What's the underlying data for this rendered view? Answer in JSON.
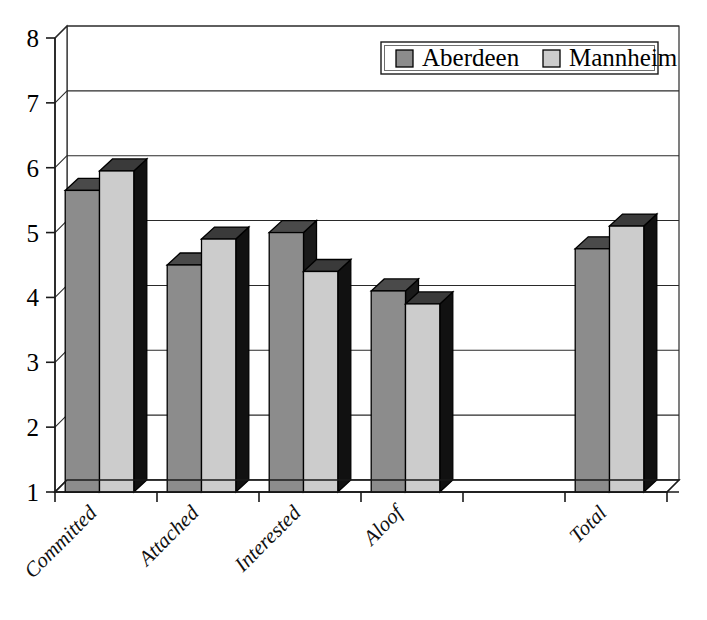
{
  "chart_data": {
    "type": "bar",
    "title": "",
    "subtitle": "",
    "xlabel": "",
    "ylabel": "",
    "ylim": [
      1,
      8
    ],
    "yticks": [
      1,
      2,
      3,
      4,
      5,
      6,
      7,
      8
    ],
    "ytick_labels": [
      "1",
      "2",
      "3",
      "4",
      "5",
      "6",
      "7",
      "8"
    ],
    "grid": true,
    "grid_axis": "y",
    "three_d": true,
    "legend_position": "top-right",
    "categories": [
      "Committed",
      "Attached",
      "Interested",
      "Aloof",
      "",
      "Total"
    ],
    "series": [
      {
        "name": "Aberdeen",
        "color": "#8c8c8c",
        "top_color": "#4a4a4a",
        "side_color": "#1a1a1a",
        "values": [
          5.65,
          4.5,
          5.0,
          4.1,
          null,
          4.75
        ]
      },
      {
        "name": "Mannheim",
        "color": "#cccccc",
        "top_color": "#3a3a3a",
        "side_color": "#111111",
        "values": [
          5.95,
          4.9,
          4.4,
          3.9,
          null,
          5.1
        ]
      }
    ]
  },
  "legend": {
    "entries": [
      {
        "label": "Aberdeen",
        "swatch_color": "#8c8c8c"
      },
      {
        "label": "Mannheim",
        "swatch_color": "#cccccc"
      }
    ]
  },
  "axis": {
    "y_tick_labels": [
      "8",
      "7",
      "6",
      "5",
      "4",
      "3",
      "2",
      "1"
    ],
    "x_category_labels": [
      "Committed",
      "Attached",
      "Interested",
      "Aloof",
      "Total"
    ]
  }
}
